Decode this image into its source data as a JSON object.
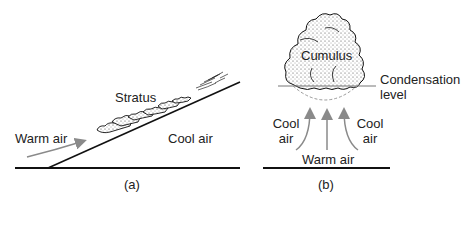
{
  "panel_a": {
    "caption": "(a)",
    "labels": {
      "cloud": "Stratus",
      "warm": "Warm air",
      "cool": "Cool air"
    }
  },
  "panel_b": {
    "caption": "(b)",
    "labels": {
      "cloud": "Cumulus",
      "condensation_line1": "Condensation",
      "condensation_line2": "level",
      "cool_left_line1": "Cool",
      "cool_left_line2": "air",
      "cool_right_line1": "Cool",
      "cool_right_line2": "air",
      "warm": "Warm air"
    }
  },
  "colors": {
    "line": "#111111",
    "arrow": "#8a8a8a",
    "cloud_fill": "#ffffff",
    "cloud_stipple": "#333333",
    "dashed": "#9a9a9a"
  }
}
